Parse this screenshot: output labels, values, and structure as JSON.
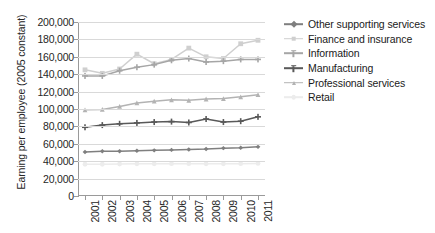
{
  "chart_data": {
    "type": "line",
    "title": "",
    "xlabel": "",
    "ylabel": "Earning per employee (2005 constant)",
    "categories": [
      "2001",
      "2002",
      "2003",
      "2004",
      "2005",
      "2006",
      "2007",
      "2008",
      "2009",
      "2010",
      "2011"
    ],
    "ylim": [
      0,
      200000
    ],
    "ytick_step": 20000,
    "ytick_labels": [
      "200,000",
      "180,000",
      "160,000",
      "140,000",
      "120,000",
      "100,000",
      "80,000",
      "60,000",
      "40,000",
      "20,000",
      "0"
    ],
    "ytick_values": [
      200000,
      180000,
      160000,
      140000,
      120000,
      100000,
      80000,
      60000,
      40000,
      20000,
      0
    ],
    "grid": true,
    "legend_position": "right",
    "series": [
      {
        "name": "Other supporting services",
        "color": "#7f7f7f",
        "marker": "diamond",
        "values": [
          50500,
          51500,
          51500,
          52000,
          52500,
          53000,
          53500,
          54000,
          55000,
          55500,
          56500
        ]
      },
      {
        "name": "Finance and insurance",
        "color": "#cfcfcf",
        "marker": "square",
        "values": [
          145000,
          141000,
          146000,
          163000,
          152000,
          157000,
          170000,
          160000,
          158000,
          175000,
          179000
        ]
      },
      {
        "name": "Information",
        "color": "#a6a6a6",
        "marker": "plus",
        "values": [
          138000,
          138000,
          144000,
          148000,
          151000,
          156000,
          158000,
          154000,
          155000,
          157000,
          157000
        ]
      },
      {
        "name": "Manufacturing",
        "color": "#595959",
        "marker": "plus",
        "values": [
          79000,
          81500,
          83000,
          84000,
          85000,
          85500,
          84500,
          88500,
          85000,
          86000,
          91000
        ]
      },
      {
        "name": "Professional services",
        "color": "#b3b3b3",
        "marker": "triangle",
        "values": [
          99000,
          99500,
          103000,
          107000,
          109000,
          110500,
          110000,
          111500,
          112000,
          114000,
          116500
        ]
      },
      {
        "name": "Retail",
        "color": "#ececec",
        "marker": "circle",
        "values": [
          36500,
          36500,
          36800,
          37000,
          37000,
          37200,
          37200,
          37000,
          37000,
          37200,
          37500
        ]
      }
    ]
  },
  "legend": {
    "items": [
      {
        "label": "Other supporting services"
      },
      {
        "label": "Finance and insurance"
      },
      {
        "label": "Information"
      },
      {
        "label": "Manufacturing"
      },
      {
        "label": "Professional services"
      },
      {
        "label": "Retail"
      }
    ]
  }
}
